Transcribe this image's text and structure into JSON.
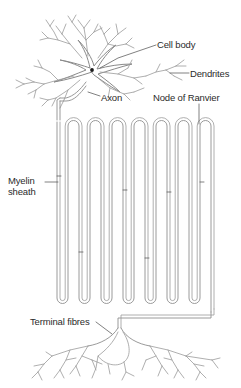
{
  "figure": {
    "background_color": "#ffffff",
    "stroke_color": "#8f8f8f",
    "stroke_color_dark": "#6e6e6e",
    "text_color": "#2b2b2b",
    "width": 241,
    "height": 388
  },
  "labels": {
    "cell_body": "Cell body",
    "dendrites": "Dendrites",
    "axon": "Axon",
    "node_of_ranvier": "Node of Ranvier",
    "myelin_sheath_line1": "Myelin",
    "myelin_sheath_line2": "sheath",
    "terminal_fibres": "Terminal fibres"
  },
  "structures": {
    "soma": "cell-body-soma",
    "nucleus": "nucleus-dot",
    "dendrite_count": 7,
    "myelin_loops_top": 11,
    "myelin_loops_bottom": 11,
    "terminal_branch_count": 6
  }
}
